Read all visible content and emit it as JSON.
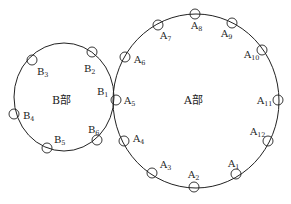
{
  "diagram": {
    "type": "two-circle bolt/hole layout",
    "part_b": {
      "name": "B部",
      "points": [
        {
          "id": "B1",
          "letter": "B",
          "index": "1"
        },
        {
          "id": "B2",
          "letter": "B",
          "index": "2"
        },
        {
          "id": "B3",
          "letter": "B",
          "index": "3"
        },
        {
          "id": "B4",
          "letter": "B",
          "index": "4"
        },
        {
          "id": "B5",
          "letter": "B",
          "index": "5"
        },
        {
          "id": "B6",
          "letter": "B",
          "index": "6"
        }
      ]
    },
    "part_a": {
      "name": "A部",
      "points": [
        {
          "id": "A1",
          "letter": "A",
          "index": "1"
        },
        {
          "id": "A2",
          "letter": "A",
          "index": "2"
        },
        {
          "id": "A3",
          "letter": "A",
          "index": "3"
        },
        {
          "id": "A4",
          "letter": "A",
          "index": "4"
        },
        {
          "id": "A5",
          "letter": "A",
          "index": "5"
        },
        {
          "id": "A6",
          "letter": "A",
          "index": "6"
        },
        {
          "id": "A7",
          "letter": "A",
          "index": "7"
        },
        {
          "id": "A8",
          "letter": "A",
          "index": "8"
        },
        {
          "id": "A9",
          "letter": "A",
          "index": "9"
        },
        {
          "id": "A10",
          "letter": "A",
          "index": "10"
        },
        {
          "id": "A11",
          "letter": "A",
          "index": "11"
        },
        {
          "id": "A12",
          "letter": "A",
          "index": "12"
        }
      ]
    },
    "colors": {
      "stroke": "#222222",
      "background": "#ffffff"
    }
  }
}
